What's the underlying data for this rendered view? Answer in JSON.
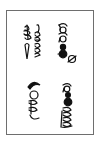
{
  "document": {
    "description": "Scanned page with rotated handwritten symbol glyphs",
    "border_color": "#6e6e6e",
    "ink_color": "#111111",
    "groups": [
      {
        "name": "top-left",
        "label": "glyph cluster with looped strokes"
      },
      {
        "name": "top-right",
        "label": "glyph column with filled dots"
      },
      {
        "name": "bottom-left",
        "label": "glyph column with crescent"
      },
      {
        "name": "bottom-right",
        "label": "glyph column with filled dots and scribble"
      }
    ]
  }
}
